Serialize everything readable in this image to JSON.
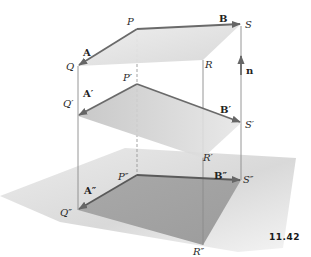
{
  "figure": {
    "number": "11.42"
  },
  "colors": {
    "background": "#ffffff",
    "ground_plane": "#d9d9d9",
    "top_plane": "#e4e4e4",
    "middle_plane": "#c9c9c9",
    "bottom_plane": "#a8a8a8",
    "vector_stroke": "#6a6a6a",
    "edge_stroke": "#8a8a8a"
  },
  "labels": {
    "P": "P",
    "Q": "Q",
    "R": "R",
    "S": "S",
    "P1": "P′",
    "Q1": "Q′",
    "R1": "R′",
    "S1": "S′",
    "P2": "P″",
    "Q2": "Q″",
    "R2": "R″",
    "S2": "S″",
    "A": "A",
    "B": "B",
    "A1": "A′",
    "B1": "B′",
    "A2": "A″",
    "B2": "B″",
    "n": "n"
  }
}
